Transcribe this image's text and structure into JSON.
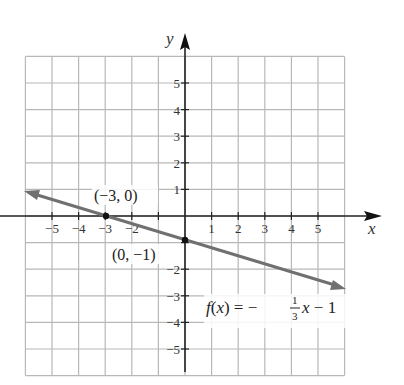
{
  "chart_data": {
    "type": "line",
    "title": "",
    "xlabel": "x",
    "ylabel": "y",
    "xlim": [
      -6,
      6
    ],
    "ylim": [
      -6,
      6
    ],
    "grid": true,
    "x_ticks": [
      "−5",
      "−4",
      "−3",
      "−2",
      "−1",
      "1",
      "2",
      "3",
      "4",
      "5"
    ],
    "y_ticks": [
      "5",
      "4",
      "3",
      "2",
      "1",
      "−2",
      "−3",
      "−4",
      "−5"
    ],
    "series": [
      {
        "name": "f(x) = −(1/3)x − 1",
        "x": [
          -6,
          6
        ],
        "y": [
          1,
          -3
        ],
        "color": "#707070"
      }
    ],
    "points": [
      {
        "label": "(−3, 0)",
        "x": -3,
        "y": 0
      },
      {
        "label": "(0, −1)",
        "x": 0,
        "y": -1
      }
    ],
    "annotations": [
      {
        "text": "f(x) = −1/3 x − 1",
        "x": 3.5,
        "y": -3.4
      }
    ]
  },
  "labels": {
    "x_axis": "x",
    "y_axis": "y",
    "point_a": "(−3, 0)",
    "point_b": "(0, −1)",
    "fn_lhs": "f(x) = −",
    "fn_num": "1",
    "fn_den": "3",
    "fn_rhs": "x − 1"
  }
}
